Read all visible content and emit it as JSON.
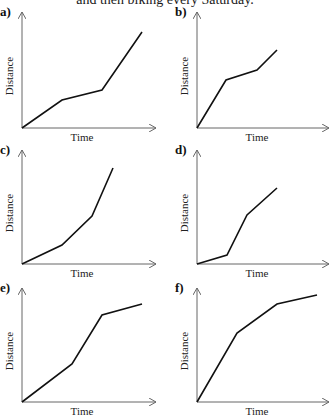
{
  "header": {
    "text": "and then biking every Saturday."
  },
  "axis_labels": {
    "x": "Time",
    "y": "Distance"
  },
  "panels": [
    {
      "label": "a)",
      "origin": [
        22,
        128
      ],
      "ytop": 12,
      "xend": 156,
      "points": [
        [
          22,
          128
        ],
        [
          62,
          100
        ],
        [
          102,
          90
        ],
        [
          142,
          32
        ]
      ]
    },
    {
      "label": "b)",
      "origin": [
        197,
        128
      ],
      "ytop": 12,
      "xend": 329,
      "points": [
        [
          197,
          128
        ],
        [
          226,
          80
        ],
        [
          257,
          70
        ],
        [
          277,
          50
        ]
      ]
    },
    {
      "label": "c)",
      "origin": [
        22,
        264
      ],
      "ytop": 150,
      "xend": 156,
      "points": [
        [
          22,
          264
        ],
        [
          62,
          245
        ],
        [
          92,
          216
        ],
        [
          113,
          168
        ]
      ]
    },
    {
      "label": "d)",
      "origin": [
        197,
        264
      ],
      "ytop": 150,
      "xend": 329,
      "points": [
        [
          197,
          264
        ],
        [
          227,
          255
        ],
        [
          247,
          215
        ],
        [
          277,
          188
        ]
      ]
    },
    {
      "label": "e)",
      "origin": [
        22,
        402
      ],
      "ytop": 288,
      "xend": 156,
      "points": [
        [
          22,
          402
        ],
        [
          72,
          364
        ],
        [
          102,
          315
        ],
        [
          142,
          304
        ]
      ]
    },
    {
      "label": "f)",
      "origin": [
        197,
        402
      ],
      "ytop": 288,
      "xend": 329,
      "points": [
        [
          197,
          402
        ],
        [
          237,
          333
        ],
        [
          277,
          304
        ],
        [
          317,
          295
        ]
      ]
    }
  ],
  "chart_data": [
    {
      "type": "line",
      "title": "a)",
      "xlabel": "Time",
      "ylabel": "Distance",
      "x": [
        0,
        1,
        2,
        3
      ],
      "values": [
        0,
        2.4,
        3.3,
        8.3
      ],
      "note": "slow, slower, then steep fastest final segment"
    },
    {
      "type": "line",
      "title": "b)",
      "xlabel": "Time",
      "ylabel": "Distance",
      "x": [
        0,
        1,
        2,
        2.7
      ],
      "values": [
        0,
        4.1,
        5.0,
        6.7
      ],
      "note": "steep start, then shallow, then moderate"
    },
    {
      "type": "line",
      "title": "c)",
      "xlabel": "Time",
      "ylabel": "Distance",
      "x": [
        0,
        1.3,
        2.3,
        3.0
      ],
      "values": [
        0,
        1.6,
        4.1,
        8.3
      ],
      "note": "increasingly steep segments"
    },
    {
      "type": "line",
      "title": "d)",
      "xlabel": "Time",
      "ylabel": "Distance",
      "x": [
        0,
        1.0,
        1.7,
        2.7
      ],
      "values": [
        0,
        0.8,
        4.3,
        6.6
      ],
      "note": "shallow, steep, then moderate"
    },
    {
      "type": "line",
      "title": "e)",
      "xlabel": "Time",
      "ylabel": "Distance",
      "x": [
        0,
        1.7,
        2.7,
        4.0
      ],
      "values": [
        0,
        3.3,
        7.5,
        8.4
      ],
      "note": "moderate, steeper, then nearly flat"
    },
    {
      "type": "line",
      "title": "f)",
      "xlabel": "Time",
      "ylabel": "Distance",
      "x": [
        0,
        1.3,
        2.7,
        4.0
      ],
      "values": [
        0,
        5.9,
        8.4,
        9.2
      ],
      "note": "decreasingly steep segments"
    }
  ]
}
